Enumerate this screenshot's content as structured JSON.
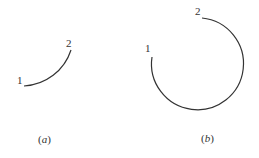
{
  "figure_a": {
    "start_label": "1",
    "end_label": "2",
    "caption_open": "(",
    "caption_letter": "a",
    "caption_close": ")"
  },
  "figure_b": {
    "start_label": "1",
    "end_label": "2",
    "caption_open": "(",
    "caption_letter": "b",
    "caption_close": ")"
  },
  "colors": {
    "stroke": "#333333"
  }
}
